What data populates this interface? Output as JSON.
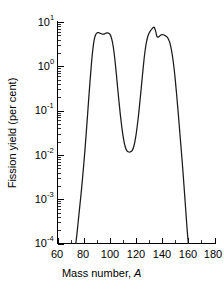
{
  "chart_data": {
    "type": "line",
    "title": "",
    "xlabel": "Mass number, A",
    "xlabel_main": "Mass number,",
    "xlabel_italic": "A",
    "ylabel": "Fission yield (per cent)",
    "xlim": [
      60,
      180
    ],
    "ylim": [
      0.0001,
      10
    ],
    "yscale": "log",
    "xscale": "linear",
    "grid": false,
    "legend": null,
    "x_ticks": [
      60,
      80,
      100,
      120,
      140,
      160,
      180
    ],
    "x_tick_labels": [
      "60",
      "80",
      "100",
      "120",
      "140",
      "160",
      "180"
    ],
    "x_minor_ticks": [
      70,
      90,
      110,
      130,
      150,
      170
    ],
    "y_ticks": [
      10,
      1,
      0.1,
      0.01,
      0.001,
      0.0001
    ],
    "y_tick_labels": [
      "10¹",
      "10⁰",
      "10⁻¹",
      "10⁻²",
      "10⁻³",
      "10⁻⁴"
    ],
    "y_tick_mantissa": [
      "10",
      "10",
      "10",
      "10",
      "10",
      "10"
    ],
    "y_tick_exponent": [
      "1",
      "0",
      "-1",
      "-2",
      "-3",
      "-4"
    ],
    "series": [
      {
        "name": "Fission yield",
        "color": "#1a1a1a",
        "x": [
          74,
          75,
          76,
          77,
          78,
          79,
          80,
          81,
          82,
          83,
          84,
          85,
          86,
          87,
          88,
          89,
          90,
          91,
          92,
          93,
          94,
          95,
          96,
          97,
          98,
          99,
          100,
          101,
          102,
          103,
          104,
          105,
          106,
          107,
          108,
          109,
          110,
          111,
          112,
          113,
          114,
          115,
          116,
          117,
          118,
          119,
          120,
          121,
          122,
          123,
          124,
          125,
          126,
          127,
          128,
          129,
          130,
          131,
          132,
          133,
          134,
          135,
          136,
          137,
          138,
          139,
          140,
          141,
          142,
          143,
          144,
          145,
          146,
          147,
          148,
          149,
          150,
          151,
          152,
          153,
          154,
          155,
          156,
          157,
          158,
          159,
          160
        ],
        "y": [
          0.0001,
          0.00018,
          0.00035,
          0.00068,
          0.0013,
          0.0027,
          0.0058,
          0.013,
          0.032,
          0.082,
          0.21,
          0.52,
          1.2,
          2.4,
          3.9,
          5.0,
          5.6,
          5.75,
          5.7,
          5.5,
          5.35,
          5.3,
          5.4,
          5.6,
          5.7,
          5.6,
          5.3,
          4.6,
          3.5,
          2.3,
          1.3,
          0.66,
          0.32,
          0.16,
          0.082,
          0.046,
          0.028,
          0.019,
          0.0145,
          0.0125,
          0.0118,
          0.0116,
          0.0118,
          0.0125,
          0.0145,
          0.019,
          0.028,
          0.046,
          0.082,
          0.16,
          0.32,
          0.66,
          1.3,
          2.3,
          3.5,
          4.7,
          5.6,
          6.3,
          6.9,
          7.4,
          7.6,
          6.2,
          4.7,
          4.55,
          4.8,
          5.1,
          5.2,
          5.15,
          5.0,
          4.8,
          4.5,
          4.0,
          3.3,
          2.4,
          1.6,
          0.95,
          0.5,
          0.24,
          0.11,
          0.048,
          0.021,
          0.0092,
          0.0038,
          0.0015,
          0.00058,
          0.00022,
          0.0001
        ]
      }
    ],
    "annotations": [
      {
        "label": "left peak maximum",
        "x": 97,
        "y": 5.7
      },
      {
        "label": "valley minimum",
        "x": 116,
        "y": 0.0116
      },
      {
        "label": "right peak maximum",
        "x": 134,
        "y": 7.6
      }
    ]
  }
}
